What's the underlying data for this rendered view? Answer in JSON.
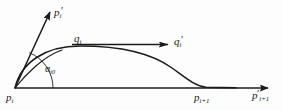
{
  "figure": {
    "background_color": "#fdfdfd",
    "stroke_color": "#1a1a1a",
    "width": 282,
    "height": 111
  },
  "labels": {
    "p_prime_i": {
      "base": "p",
      "sub": "i",
      "prime": "′"
    },
    "q_i": {
      "base": "q",
      "sub": "i",
      "prime": ""
    },
    "q_prime_i": {
      "base": "q",
      "sub": "i",
      "prime": "′"
    },
    "alpha": {
      "base": "α",
      "sub": "i0",
      "prime": ""
    },
    "p_i": {
      "base": "p",
      "sub": "i",
      "prime": ""
    },
    "p_i_plus_1": {
      "base": "p",
      "sub": "i+1",
      "prime": ""
    },
    "p_prime_i_plus_1": {
      "base": "p",
      "sub": "i+1",
      "prime": "′"
    }
  },
  "geometry": {
    "origin": {
      "x": 15,
      "y": 88
    },
    "axis_end": {
      "x": 272,
      "y": 88
    },
    "tangent_vector_tip": {
      "x": 52,
      "y": 9
    },
    "q_arrow": {
      "x1": 76,
      "y1": 44,
      "x2": 170,
      "y2": 44
    },
    "curve_peak": {
      "x": 80,
      "y": 46
    },
    "curve_end": {
      "x": 205,
      "y": 87
    },
    "angle_arc_radius": 38,
    "angle_degrees": 68
  }
}
